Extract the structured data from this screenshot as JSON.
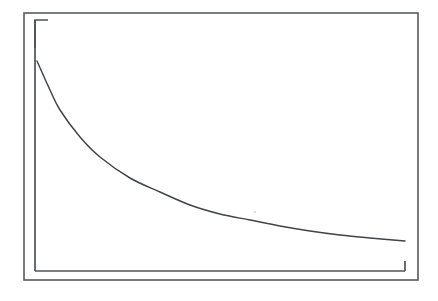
{
  "figure": {
    "name": "exponential-decay-plot",
    "appearance": "scanned monochrome line drawing",
    "background_color": "#ffffff",
    "line_color": "#3f4448",
    "frame_color": "#555b5e",
    "axis_color": "#4e5356",
    "title": "",
    "subtitle": "",
    "caption": "",
    "width_px": 438,
    "height_px": 301
  },
  "frame": {
    "name": "outer-border-rectangle",
    "x": 24,
    "y": 13,
    "width": 394,
    "height": 267,
    "stroke_width": 1.6
  },
  "axes": {
    "origin_x": 35,
    "origin_y": 271,
    "y_axis_top": 20,
    "x_axis_right": 405,
    "y_axis_label": "",
    "x_axis_label": "",
    "y_tick_labels": [],
    "x_tick_labels": [],
    "grid": false,
    "top_left_bracket_stub_x2": 48,
    "bottom_right_bracket_stub_y2": 261
  },
  "chart_data": {
    "type": "line",
    "title": "",
    "subtitle": "",
    "xlabel": "",
    "ylabel": "",
    "grid": false,
    "legend": [],
    "legend_position": "none",
    "annotations": [],
    "xlim": [
      0,
      1
    ],
    "ylim": [
      0,
      1
    ],
    "x_tick_labels": [],
    "y_tick_labels": [],
    "series": [
      {
        "name": "decay",
        "curve_shape": "exponential decay",
        "x": [
          0.005,
          0.036,
          0.063,
          0.118,
          0.172,
          0.253,
          0.335,
          0.416,
          0.497,
          0.578,
          0.66,
          0.741,
          0.822,
          0.903,
          0.997
        ],
        "y": [
          0.837,
          0.721,
          0.642,
          0.535,
          0.455,
          0.372,
          0.316,
          0.264,
          0.228,
          0.204,
          0.18,
          0.16,
          0.144,
          0.132,
          0.12
        ],
        "pixel_points": [
          [
            37,
            61
          ],
          [
            50,
            90
          ],
          [
            60,
            110
          ],
          [
            80,
            137
          ],
          [
            100,
            157
          ],
          [
            130,
            178
          ],
          [
            160,
            192
          ],
          [
            190,
            205
          ],
          [
            220,
            214
          ],
          [
            250,
            220
          ],
          [
            280,
            226
          ],
          [
            310,
            231
          ],
          [
            340,
            235
          ],
          [
            370,
            238
          ],
          [
            405,
            241
          ]
        ]
      }
    ]
  }
}
